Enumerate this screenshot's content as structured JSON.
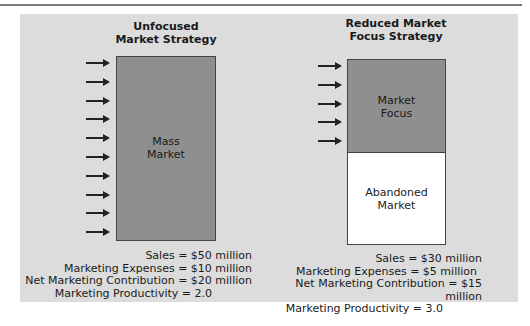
{
  "left": {
    "title_line1": "Unfocused",
    "title_line2": "Market Strategy",
    "box_label_line1": "Mass",
    "box_label_line2": "Market",
    "arrow_count": 10,
    "stats": [
      "Sales = $50 million",
      "Marketing Expenses = $10 million",
      "Net Marketing Contribution = $20 million",
      "Marketing Productivity = 2.0"
    ]
  },
  "right": {
    "title_line1": "Reduced Market",
    "title_line2": "Focus Strategy",
    "focus_label_line1": "Market",
    "focus_label_line2": "Focus",
    "abandoned_label_line1": "Abandoned",
    "abandoned_label_line2": "Market",
    "arrow_count": 5,
    "stats": [
      "Sales = $30 million",
      "Marketing Expenses = $5 million",
      "Net Marketing Contribution = $15 million",
      "Marketing Productivity = 3.0"
    ]
  },
  "colors": {
    "panel": "#dcdcdc",
    "market_box": "#8f8f8f",
    "abandoned_box": "#ffffff"
  }
}
